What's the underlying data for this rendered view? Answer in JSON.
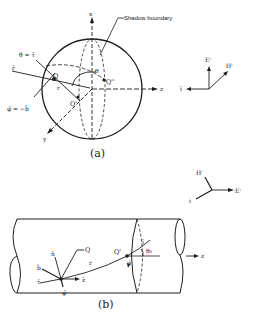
{
  "figure_a": {
    "caption": "(a)",
    "shadow_boundary_label": "Shadow boundary",
    "axis_x": "x",
    "axis_y": "y",
    "axis_z": "z",
    "point_Q": "Q",
    "point_Q_prime": "Q'",
    "point_Q_double_prime": "Q''",
    "theta": "θ",
    "r_label": "r",
    "theta_eq": "θ̂ = τ̂",
    "phi_eq": "φ̂ = −b̂",
    "r_hat": "r̂",
    "incident": {
      "E": "Eⁱ",
      "H": "Hⁱ",
      "i": "î"
    }
  },
  "figure_b": {
    "caption": "(b)",
    "axis_z": "z",
    "point_Q": "Q",
    "point_Q_prime": "Q'",
    "n_hat": "n̂",
    "b_hat": "b̂",
    "tau_hat": "τ̂",
    "z_hat": "ẑ",
    "phi_hat_1": "φ̂",
    "phi_hat_2": "φ̂",
    "i_hat": "î",
    "theta0": "θ₀",
    "r_label": "r",
    "incident": {
      "E": "Eⁱ",
      "H": "Hⁱ",
      "i": "i"
    }
  }
}
